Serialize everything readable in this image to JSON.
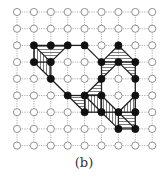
{
  "caption": "(b)",
  "grid": {
    "cols": 9,
    "rows": 9,
    "origin_x": 17,
    "origin_y": 12,
    "step_x": 16.9,
    "step_y": 16.7,
    "node_radius": 3.6
  },
  "colors": {
    "grid_line": "#9a9a9a",
    "open_node_stroke": "#777777",
    "open_node_fill": "#ffffff",
    "filled_node": "#111111",
    "edge": "#222222",
    "hatch": "#444444"
  },
  "filled_nodes": [
    [
      1,
      2
    ],
    [
      2,
      2
    ],
    [
      3,
      2
    ],
    [
      4,
      2
    ],
    [
      6,
      2
    ],
    [
      1,
      3
    ],
    [
      2,
      3
    ],
    [
      5,
      3
    ],
    [
      6,
      3
    ],
    [
      7,
      3
    ],
    [
      2,
      4
    ],
    [
      5,
      4
    ],
    [
      7,
      4
    ],
    [
      3,
      5
    ],
    [
      4,
      5
    ],
    [
      5,
      5
    ],
    [
      7,
      5
    ],
    [
      4,
      6
    ],
    [
      5,
      6
    ],
    [
      6,
      6
    ],
    [
      7,
      6
    ],
    [
      6,
      7
    ],
    [
      7,
      7
    ]
  ],
  "edges": [
    [
      [
        1,
        2
      ],
      [
        2,
        2
      ]
    ],
    [
      [
        2,
        2
      ],
      [
        3,
        2
      ]
    ],
    [
      [
        3,
        2
      ],
      [
        4,
        2
      ]
    ],
    [
      [
        4,
        2
      ],
      [
        5,
        3
      ]
    ],
    [
      [
        1,
        2
      ],
      [
        1,
        3
      ]
    ],
    [
      [
        1,
        3
      ],
      [
        2,
        3
      ]
    ],
    [
      [
        1,
        2
      ],
      [
        2,
        3
      ]
    ],
    [
      [
        2,
        3
      ],
      [
        3,
        2
      ]
    ],
    [
      [
        2,
        3
      ],
      [
        2,
        4
      ]
    ],
    [
      [
        1,
        3
      ],
      [
        2,
        4
      ]
    ],
    [
      [
        2,
        4
      ],
      [
        3,
        5
      ]
    ],
    [
      [
        3,
        5
      ],
      [
        4,
        6
      ]
    ],
    [
      [
        6,
        2
      ],
      [
        5,
        3
      ]
    ],
    [
      [
        6,
        2
      ],
      [
        7,
        3
      ]
    ],
    [
      [
        5,
        3
      ],
      [
        6,
        3
      ]
    ],
    [
      [
        6,
        3
      ],
      [
        7,
        3
      ]
    ],
    [
      [
        5,
        3
      ],
      [
        5,
        4
      ]
    ],
    [
      [
        6,
        3
      ],
      [
        5,
        4
      ]
    ],
    [
      [
        6,
        3
      ],
      [
        7,
        4
      ]
    ],
    [
      [
        7,
        3
      ],
      [
        7,
        4
      ]
    ],
    [
      [
        5,
        4
      ],
      [
        4,
        5
      ]
    ],
    [
      [
        5,
        4
      ],
      [
        5,
        5
      ]
    ],
    [
      [
        7,
        4
      ],
      [
        7,
        5
      ]
    ],
    [
      [
        3,
        5
      ],
      [
        4,
        5
      ]
    ],
    [
      [
        4,
        5
      ],
      [
        5,
        5
      ]
    ],
    [
      [
        4,
        5
      ],
      [
        4,
        6
      ]
    ],
    [
      [
        4,
        5
      ],
      [
        5,
        6
      ]
    ],
    [
      [
        5,
        5
      ],
      [
        5,
        6
      ]
    ],
    [
      [
        4,
        6
      ],
      [
        5,
        6
      ]
    ],
    [
      [
        5,
        5
      ],
      [
        6,
        6
      ]
    ],
    [
      [
        5,
        6
      ],
      [
        6,
        6
      ]
    ],
    [
      [
        6,
        6
      ],
      [
        7,
        6
      ]
    ],
    [
      [
        7,
        5
      ],
      [
        7,
        6
      ]
    ],
    [
      [
        5,
        6
      ],
      [
        6,
        7
      ]
    ],
    [
      [
        6,
        6
      ],
      [
        6,
        7
      ]
    ],
    [
      [
        6,
        7
      ],
      [
        7,
        7
      ]
    ],
    [
      [
        7,
        6
      ],
      [
        7,
        7
      ]
    ],
    [
      [
        6,
        6
      ],
      [
        7,
        7
      ]
    ],
    [
      [
        7,
        5
      ],
      [
        6,
        6
      ]
    ]
  ],
  "hatched_regions": [
    {
      "points": [
        [
          1,
          2
        ],
        [
          3,
          2
        ],
        [
          2,
          3
        ]
      ],
      "direction": "horizontal"
    },
    {
      "points": [
        [
          1,
          2
        ],
        [
          2,
          3
        ],
        [
          1,
          3
        ]
      ],
      "direction": "vertical"
    },
    {
      "points": [
        [
          1,
          3
        ],
        [
          2,
          3
        ],
        [
          2,
          4
        ]
      ],
      "direction": "vertical"
    },
    {
      "points": [
        [
          6,
          2
        ],
        [
          5,
          3
        ],
        [
          7,
          3
        ]
      ],
      "direction": "horizontal"
    },
    {
      "points": [
        [
          5,
          3
        ],
        [
          6,
          3
        ],
        [
          5,
          4
        ]
      ],
      "direction": "horizontal"
    },
    {
      "points": [
        [
          6,
          3
        ],
        [
          7,
          3
        ],
        [
          7,
          4
        ]
      ],
      "direction": "horizontal"
    },
    {
      "points": [
        [
          5,
          4
        ],
        [
          4,
          5
        ],
        [
          5,
          5
        ]
      ],
      "direction": "horizontal"
    },
    {
      "points": [
        [
          3,
          5
        ],
        [
          4,
          5
        ],
        [
          4,
          6
        ]
      ],
      "direction": "horizontal"
    },
    {
      "points": [
        [
          4,
          5
        ],
        [
          5,
          5
        ],
        [
          5,
          6
        ]
      ],
      "direction": "vertical"
    },
    {
      "points": [
        [
          4,
          5
        ],
        [
          4,
          6
        ],
        [
          5,
          6
        ]
      ],
      "direction": "vertical"
    },
    {
      "points": [
        [
          5,
          5
        ],
        [
          5,
          6
        ],
        [
          6,
          6
        ]
      ],
      "direction": "vertical"
    },
    {
      "points": [
        [
          7,
          5
        ],
        [
          6,
          6
        ],
        [
          7,
          6
        ]
      ],
      "direction": "vertical"
    },
    {
      "points": [
        [
          5,
          6
        ],
        [
          6,
          6
        ],
        [
          6,
          7
        ]
      ],
      "direction": "vertical"
    },
    {
      "points": [
        [
          6,
          6
        ],
        [
          7,
          6
        ],
        [
          7,
          7
        ]
      ],
      "direction": "horizontal"
    },
    {
      "points": [
        [
          6,
          6
        ],
        [
          6,
          7
        ],
        [
          7,
          7
        ]
      ],
      "direction": "horizontal"
    }
  ]
}
